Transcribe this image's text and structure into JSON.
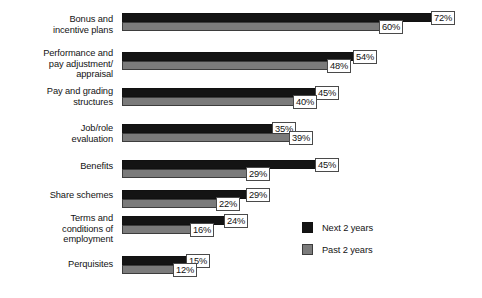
{
  "chart_data": {
    "type": "bar",
    "orientation": "horizontal",
    "title": "",
    "subtitle": "",
    "xlabel": "",
    "ylabel": "",
    "grid": false,
    "xlim": [
      0,
      72
    ],
    "value_suffix": "%",
    "legend_position": "bottom-right",
    "categories": [
      "Bonus and\nincentive plans",
      "Performance and\npay adjustment/\nappraisal",
      "Pay and grading\nstructures",
      "Job/role\nevaluation",
      "Benefits",
      "Share schemes",
      "Terms and\nconditions of\nemployment",
      "Perquisites"
    ],
    "series": [
      {
        "name": "Next 2 years",
        "color": "#141414",
        "values": [
          72,
          54,
          45,
          35,
          45,
          29,
          24,
          15
        ],
        "labels": [
          "72%",
          "54%",
          "45%",
          "35%",
          "45%",
          "29%",
          "24%",
          "15%"
        ]
      },
      {
        "name": "Past 2 years",
        "color": "#7b7b7b",
        "values": [
          60,
          48,
          40,
          39,
          29,
          22,
          16,
          12
        ],
        "labels": [
          "60%",
          "48%",
          "40%",
          "39%",
          "29%",
          "22%",
          "16%",
          "12%"
        ]
      }
    ]
  },
  "rows": [
    {
      "label_lines": [
        "Bonus and",
        "incentive plans"
      ],
      "next_label": "72%",
      "past_label": "60%",
      "next_value": 72,
      "past_value": 60
    },
    {
      "label_lines": [
        "Performance and",
        "pay adjustment/",
        "appraisal"
      ],
      "next_label": "54%",
      "past_label": "48%",
      "next_value": 54,
      "past_value": 48
    },
    {
      "label_lines": [
        "Pay and grading",
        "structures"
      ],
      "next_label": "45%",
      "past_label": "40%",
      "next_value": 45,
      "past_value": 40
    },
    {
      "label_lines": [
        "Job/role",
        "evaluation"
      ],
      "next_label": "35%",
      "past_label": "39%",
      "next_value": 35,
      "past_value": 39
    },
    {
      "label_lines": [
        "Benefits"
      ],
      "next_label": "45%",
      "past_label": "29%",
      "next_value": 45,
      "past_value": 29
    },
    {
      "label_lines": [
        "Share schemes"
      ],
      "next_label": "29%",
      "past_label": "22%",
      "next_value": 29,
      "past_value": 22
    },
    {
      "label_lines": [
        "Terms and",
        "conditions of",
        "employment"
      ],
      "next_label": "24%",
      "past_label": "16%",
      "next_value": 24,
      "past_value": 16
    },
    {
      "label_lines": [
        "Perquisites"
      ],
      "next_label": "15%",
      "past_label": "12%",
      "next_value": 15,
      "past_value": 12
    }
  ],
  "legend": {
    "items": [
      {
        "label": "Next 2 years",
        "color": "#141414"
      },
      {
        "label": "Past 2 years",
        "color": "#7b7b7b"
      }
    ]
  },
  "layout": {
    "bar_origin_x": 122,
    "px_per_percent": 4.3,
    "row_tops": [
      13,
      52,
      88,
      124,
      160,
      190,
      216,
      256
    ],
    "label_tops": [
      14,
      48,
      86,
      123,
      161,
      190,
      213,
      259
    ]
  }
}
